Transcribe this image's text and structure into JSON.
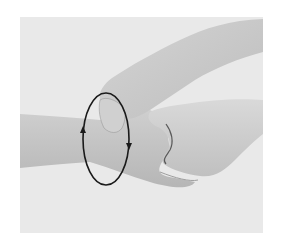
{
  "image": {
    "description": "Grayscale instructional photo: one hand grips a forearm at the wrist while a second hand holds the back of the wrist; an elliptical loop with two arrowheads indicates a rotating motion around the wrist.",
    "colors": {
      "page_background": "#ffffff",
      "photo_background": "#e9e9e9",
      "skin_light": "#d6d6d6",
      "skin_mid": "#c4c4c4",
      "skin_shadow": "#a9a9a9",
      "loop_stroke": "#1a1a1a"
    },
    "annotation": {
      "shape": "ellipse",
      "center": [
        106,
        139
      ],
      "rx": 23,
      "ry": 46,
      "arrows": [
        {
          "side": "left",
          "direction": "up",
          "at": [
            83,
            130
          ]
        },
        {
          "side": "right",
          "direction": "down",
          "at": [
            129,
            146
          ]
        }
      ]
    }
  }
}
